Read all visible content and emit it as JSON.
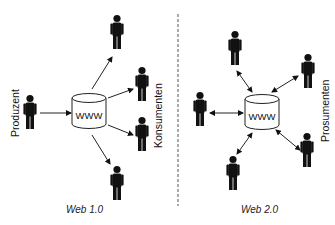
{
  "web1": {
    "caption": "Web 1.0",
    "hub_label": "WWW",
    "producer_label": "Produzent",
    "consumer_label": "Konsumenten",
    "arrow_style": "one-way"
  },
  "web2": {
    "caption": "Web 2.0",
    "hub_label": "WWW",
    "prosumer_label": "Prosumenten",
    "arrow_style": "two-way"
  },
  "colors": {
    "figure": "#111111",
    "line": "#222222",
    "divider": "#555555",
    "background": "#ffffff"
  }
}
